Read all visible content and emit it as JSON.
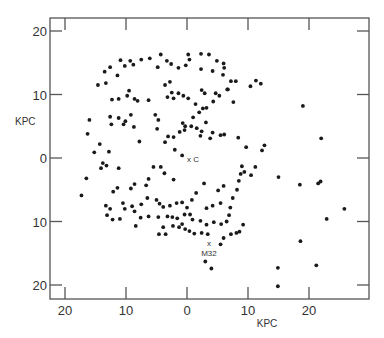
{
  "chart_data": {
    "type": "scatter",
    "title": "",
    "xlabel": "KPC",
    "ylabel": "KPC",
    "xlim": [
      -22,
      30
    ],
    "ylim": [
      -22,
      22
    ],
    "x_ticks": [
      {
        "value": -20,
        "label": "20"
      },
      {
        "value": -10,
        "label": "10"
      },
      {
        "value": 0,
        "label": "0"
      },
      {
        "value": 10,
        "label": "10"
      },
      {
        "value": 20,
        "label": "20"
      }
    ],
    "y_ticks": [
      {
        "value": 20,
        "label": "20"
      },
      {
        "value": 10,
        "label": "10"
      },
      {
        "value": 0,
        "label": "0"
      },
      {
        "value": -10,
        "label": "10"
      },
      {
        "value": -20,
        "label": "20"
      }
    ],
    "grid": false,
    "legend": null,
    "annotations": [
      {
        "text": "x C",
        "x": 1.0,
        "y": -0.2
      },
      {
        "text": "x",
        "x": 3.6,
        "y": -13.4
      },
      {
        "text": "M32",
        "x": 3.6,
        "y": -14.9
      }
    ],
    "series": [
      {
        "name": "points",
        "points": [
          [
            -4.3,
            16.3
          ],
          [
            -6.1,
            15.7
          ],
          [
            -7.5,
            15.5
          ],
          [
            -9.3,
            15.3
          ],
          [
            -10.9,
            15.4
          ],
          [
            -8.8,
            14.7
          ],
          [
            -10.2,
            14.5
          ],
          [
            -12.6,
            14.3
          ],
          [
            -13.5,
            13.6
          ],
          [
            -11.4,
            13.0
          ],
          [
            -14.6,
            11.5
          ],
          [
            -3.3,
            15.3
          ],
          [
            0.2,
            16.3
          ],
          [
            -4.8,
            14.3
          ],
          [
            -2.6,
            14.8
          ],
          [
            -1.4,
            14.2
          ],
          [
            -0.2,
            14.6
          ],
          [
            0.4,
            15.5
          ],
          [
            2.3,
            16.4
          ],
          [
            3.6,
            16.3
          ],
          [
            4.9,
            15.3
          ],
          [
            6.0,
            14.9
          ],
          [
            -12.3,
            9.2
          ],
          [
            -11.2,
            9.3
          ],
          [
            -9.8,
            9.8
          ],
          [
            -8.6,
            9.3
          ],
          [
            -8.1,
            9.0
          ],
          [
            -9.5,
            10.6
          ],
          [
            -13.3,
            11.8
          ],
          [
            -3.6,
            11.5
          ],
          [
            -2.8,
            12.0
          ],
          [
            -2.5,
            10.3
          ],
          [
            -1.4,
            10.2
          ],
          [
            -0.6,
            9.8
          ],
          [
            -2.2,
            9.4
          ],
          [
            -3.2,
            9.6
          ],
          [
            2.3,
            14.0
          ],
          [
            4.2,
            13.7
          ],
          [
            5.9,
            13.1
          ],
          [
            6.1,
            14.2
          ],
          [
            7.2,
            12.1
          ],
          [
            8.0,
            12.1
          ],
          [
            4.7,
            10.2
          ],
          [
            6.7,
            10.8
          ],
          [
            5.3,
            9.8
          ],
          [
            2.9,
            10.2
          ],
          [
            2.4,
            10.7
          ],
          [
            4.3,
            8.9
          ],
          [
            6.6,
            10.8
          ],
          [
            7.6,
            8.8
          ],
          [
            10.4,
            11.3
          ],
          [
            11.3,
            12.2
          ],
          [
            12.1,
            11.7
          ],
          [
            -16.0,
            6.0
          ],
          [
            -16.3,
            3.8
          ],
          [
            -15.2,
            0.9
          ],
          [
            -14.3,
            2.2
          ],
          [
            -12.6,
            6.5
          ],
          [
            -12.4,
            5.3
          ],
          [
            -11.2,
            6.3
          ],
          [
            -10.4,
            5.3
          ],
          [
            -10.1,
            5.8
          ],
          [
            -9.2,
            6.8
          ],
          [
            -8.7,
            4.9
          ],
          [
            -7.8,
            2.6
          ],
          [
            -6.3,
            9.1
          ],
          [
            -5.2,
            6.8
          ],
          [
            -4.7,
            6.0
          ],
          [
            -4.9,
            4.6
          ],
          [
            -3.6,
            2.5
          ],
          [
            -3.1,
            3.4
          ],
          [
            -2.0,
            1.3
          ],
          [
            -0.8,
            0.4
          ],
          [
            -13.2,
            -1.2
          ],
          [
            -12.8,
            1.0
          ],
          [
            -11.2,
            -1.6
          ],
          [
            0.2,
            9.4
          ],
          [
            1.4,
            8.5
          ],
          [
            2.6,
            7.8
          ],
          [
            3.2,
            7.9
          ],
          [
            2.0,
            7.2
          ],
          [
            1.0,
            6.4
          ],
          [
            0.7,
            5.0
          ],
          [
            2.2,
            3.5
          ],
          [
            3.1,
            5.6
          ],
          [
            3.8,
            3.1
          ],
          [
            -1.2,
            4.1
          ],
          [
            -0.3,
            5.0
          ],
          [
            -0.7,
            5.5
          ],
          [
            -0.4,
            4.4
          ],
          [
            -2.2,
            3.3
          ],
          [
            1.6,
            4.7
          ],
          [
            2.4,
            4.2
          ],
          [
            4.2,
            4.0
          ],
          [
            5.5,
            3.6
          ],
          [
            6.1,
            3.7
          ],
          [
            8.4,
            3.2
          ],
          [
            9.7,
            1.7
          ],
          [
            11.2,
            -1.4
          ],
          [
            12.3,
            1.2
          ],
          [
            12.7,
            2.0
          ],
          [
            -12.1,
            -5.3
          ],
          [
            -11.4,
            -4.7
          ],
          [
            -13.3,
            -7.5
          ],
          [
            -14.1,
            -1.6
          ],
          [
            -9.2,
            -4.8
          ],
          [
            -8.6,
            -4.1
          ],
          [
            -6.7,
            -4.3
          ],
          [
            -6.3,
            -3.3
          ],
          [
            -5.5,
            -1.4
          ],
          [
            -4.3,
            -1.4
          ],
          [
            -3.7,
            -2.4
          ],
          [
            -2.2,
            -3.4
          ],
          [
            -17.3,
            -5.9
          ],
          [
            -16.5,
            -3.2
          ],
          [
            -13.8,
            -0.8
          ],
          [
            -10.5,
            -7.1
          ],
          [
            -10.2,
            -8.0
          ],
          [
            -9.0,
            -7.6
          ],
          [
            -8.6,
            -8.4
          ],
          [
            -7.5,
            -7.3
          ],
          [
            -6.5,
            -6.3
          ],
          [
            -5.0,
            -6.6
          ],
          [
            -4.5,
            -7.2
          ],
          [
            -3.9,
            -7.7
          ],
          [
            -2.8,
            -7.5
          ],
          [
            -1.7,
            -7.1
          ],
          [
            -0.8,
            -7.0
          ],
          [
            0.0,
            -7.8
          ],
          [
            -4.7,
            -9.3
          ],
          [
            -3.2,
            -9.2
          ],
          [
            -2.4,
            -9.3
          ],
          [
            -1.6,
            -9.5
          ],
          [
            -0.4,
            -8.9
          ],
          [
            0.5,
            -8.9
          ],
          [
            -6.3,
            -9.2
          ],
          [
            -2.3,
            -10.7
          ],
          [
            -1.3,
            -10.9
          ],
          [
            -0.8,
            -10.4
          ],
          [
            -3.9,
            -10.9
          ],
          [
            -4.6,
            -12.0
          ],
          [
            -3.5,
            -12.0
          ],
          [
            -7.6,
            -9.4
          ],
          [
            -8.4,
            -10.7
          ],
          [
            -11.0,
            -9.6
          ],
          [
            -12.6,
            -8.0
          ],
          [
            -13.1,
            -9.0
          ],
          [
            -12.2,
            -9.7
          ],
          [
            1.5,
            -5.5
          ],
          [
            0.8,
            -6.6
          ],
          [
            2.8,
            -4.0
          ],
          [
            5.1,
            -5.1
          ],
          [
            6.0,
            -4.4
          ],
          [
            3.2,
            -7.9
          ],
          [
            4.2,
            -7.5
          ],
          [
            5.5,
            -7.1
          ],
          [
            7.1,
            -7.8
          ],
          [
            7.5,
            -6.3
          ],
          [
            8.2,
            -5.0
          ],
          [
            8.5,
            -3.6
          ],
          [
            8.8,
            -2.5
          ],
          [
            9.4,
            -2.2
          ],
          [
            9.0,
            -1.3
          ],
          [
            10.5,
            -2.7
          ],
          [
            0.9,
            -9.7
          ],
          [
            2.2,
            -9.9
          ],
          [
            3.2,
            -10.5
          ],
          [
            4.4,
            -10.1
          ],
          [
            5.6,
            -10.4
          ],
          [
            6.5,
            -10.0
          ],
          [
            6.9,
            -9.0
          ],
          [
            7.2,
            -12.0
          ],
          [
            8.1,
            -11.8
          ],
          [
            8.6,
            -11.6
          ],
          [
            9.2,
            -10.5
          ],
          [
            6.0,
            -12.6
          ],
          [
            5.5,
            -13.6
          ],
          [
            1.2,
            -11.9
          ],
          [
            0.4,
            -11.5
          ],
          [
            -0.3,
            -11.2
          ],
          [
            2.4,
            -11.8
          ],
          [
            3.4,
            -12.0
          ],
          [
            3.0,
            -16.3
          ],
          [
            4.0,
            -17.4
          ],
          [
            15.0,
            -3.0
          ],
          [
            18.5,
            -4.2
          ],
          [
            21.5,
            -4.0
          ],
          [
            21.9,
            -3.7
          ],
          [
            19.0,
            8.2
          ],
          [
            22.0,
            3.1
          ],
          [
            25.8,
            -8.0
          ],
          [
            22.9,
            -9.6
          ],
          [
            18.6,
            -13.1
          ],
          [
            14.9,
            -17.3
          ],
          [
            21.2,
            -16.9
          ],
          [
            14.9,
            -20.2
          ]
        ]
      }
    ]
  }
}
